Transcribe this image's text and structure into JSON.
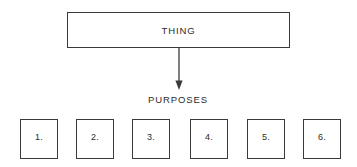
{
  "diagram": {
    "type": "hierarchy-flow",
    "background_color": "#ffffff",
    "line_color": "#3a3a3a",
    "text_color": "#2b2b2b",
    "root": {
      "label": "THING"
    },
    "connector": {
      "icon": "down-arrow-icon",
      "direction": "down"
    },
    "group_label": "PURPOSES",
    "purposes": [
      {
        "number": "1."
      },
      {
        "number": "2."
      },
      {
        "number": "3."
      },
      {
        "number": "4."
      },
      {
        "number": "5."
      },
      {
        "number": "6."
      }
    ]
  }
}
